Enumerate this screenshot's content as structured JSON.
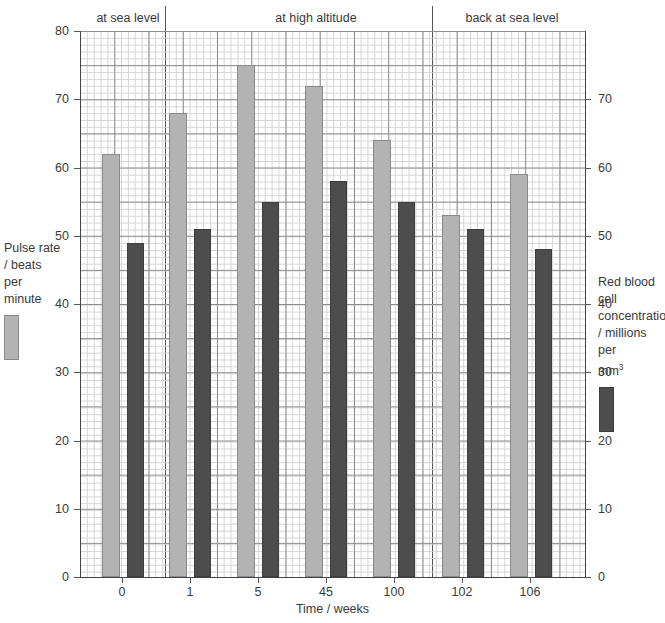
{
  "chart_data": {
    "type": "bar",
    "title": "",
    "xlabel": "Time / weeks",
    "ylabel": "Pulse rate / beats per minute",
    "y2label": "Red blood cell concentration / millions per mm3",
    "categories": [
      "0",
      "1",
      "5",
      "45",
      "100",
      "102",
      "106"
    ],
    "ylim": [
      0,
      80
    ],
    "y2lim": [
      0,
      80
    ],
    "yticks": [
      0,
      10,
      20,
      30,
      40,
      50,
      60,
      70,
      80
    ],
    "y2ticks": [
      0,
      10,
      20,
      30,
      40,
      50,
      60,
      70
    ],
    "grid": true,
    "legend_position": "outside-left-and-right",
    "series": [
      {
        "name": "Pulse rate / beats per minute",
        "color": "#b3b3b3",
        "axis": "left",
        "values": [
          62,
          68,
          75,
          72,
          64,
          53,
          59
        ]
      },
      {
        "name": "Red blood cell concentration / millions per mm3",
        "color": "#4d4d4d",
        "axis": "right",
        "values": [
          49,
          51,
          55,
          58,
          55,
          51,
          48
        ]
      }
    ],
    "sections": [
      {
        "label": "at sea level",
        "from_category": "0",
        "to_category": "0"
      },
      {
        "label": "at high altitude",
        "from_category": "1",
        "to_category": "100"
      },
      {
        "label": "back at sea level",
        "from_category": "102",
        "to_category": "106"
      }
    ]
  },
  "axes": {
    "left_ticks": [
      "80",
      "70",
      "60",
      "50",
      "40",
      "30",
      "20",
      "10",
      "0"
    ],
    "right_ticks": [
      "70",
      "60",
      "50",
      "40",
      "30",
      "20",
      "10",
      "0"
    ],
    "x_ticks": [
      "0",
      "1",
      "5",
      "45",
      "100",
      "102",
      "106"
    ],
    "x_title": "Time / weeks"
  },
  "legends": {
    "left": {
      "lines": [
        "Pulse rate",
        "/ beats",
        "per",
        "minute"
      ],
      "swatch_color": "#b3b3b3"
    },
    "right": {
      "lines": [
        "Red blood cell",
        "concentration",
        "/ millions per",
        "mm"
      ],
      "superscript": "3",
      "swatch_color": "#4d4d4d"
    }
  },
  "sections": {
    "labels": [
      "at sea level",
      "at high altitude",
      "back at sea level"
    ]
  },
  "caption": ""
}
